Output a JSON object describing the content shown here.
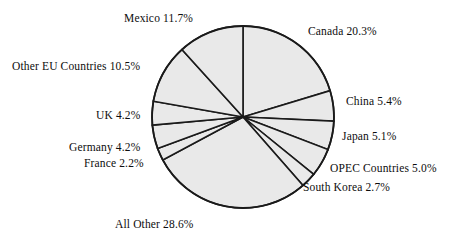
{
  "chart_data": {
    "type": "pie",
    "title": "",
    "subtitle": "",
    "xlabel": "",
    "ylabel": "",
    "legend_position": "none",
    "grid": false,
    "units": "percent",
    "start_angle_deg": 0,
    "direction": "clockwise",
    "fill_color": "#e9e9e9",
    "stroke_color": "#1a1a1a",
    "categories": [
      "Canada",
      "China",
      "Japan",
      "OPEC Countries",
      "South Korea",
      "All Other",
      "France",
      "Germany",
      "UK",
      "Other EU Countries",
      "Mexico"
    ],
    "values": [
      20.3,
      5.4,
      5.1,
      5.0,
      2.7,
      28.6,
      2.2,
      4.2,
      4.2,
      10.5,
      11.7
    ],
    "total": 99.9,
    "slices": [
      {
        "label": "Canada",
        "value": 20.3,
        "value_text": "20.3%"
      },
      {
        "label": "China",
        "value": 5.4,
        "value_text": "5.4%"
      },
      {
        "label": "Japan",
        "value": 5.1,
        "value_text": "5.1%"
      },
      {
        "label": "OPEC Countries",
        "value": 5.0,
        "value_text": "5.0%"
      },
      {
        "label": "South Korea",
        "value": 2.7,
        "value_text": "2.7%"
      },
      {
        "label": "All Other",
        "value": 28.6,
        "value_text": "28.6%"
      },
      {
        "label": "France",
        "value": 2.2,
        "value_text": "2.2%"
      },
      {
        "label": "Germany",
        "value": 4.2,
        "value_text": "4.2%"
      },
      {
        "label": "UK",
        "value": 4.2,
        "value_text": "4.2%"
      },
      {
        "label": "Other EU Countries",
        "value": 10.5,
        "value_text": "10.5%"
      },
      {
        "label": "Mexico",
        "value": 11.7,
        "value_text": "11.7%"
      }
    ]
  },
  "labels": {
    "mexico": {
      "name": "Mexico",
      "pct": "11.7%"
    },
    "canada": {
      "name": "Canada",
      "pct": "20.3%"
    },
    "other_eu": {
      "name": "Other EU Countries",
      "pct": "10.5%"
    },
    "china": {
      "name": "China",
      "pct": "5.4%"
    },
    "uk": {
      "name": "UK",
      "pct": "4.2%"
    },
    "japan": {
      "name": "Japan",
      "pct": "5.1%"
    },
    "germany": {
      "name": "Germany",
      "pct": "4.2%"
    },
    "france": {
      "name": "France",
      "pct": "2.2%"
    },
    "opec": {
      "name": "OPEC Countries",
      "pct": "5.0%"
    },
    "south_korea": {
      "name": "South Korea",
      "pct": "2.7%"
    },
    "all_other": {
      "name": "All Other",
      "pct": "28.6%"
    }
  }
}
